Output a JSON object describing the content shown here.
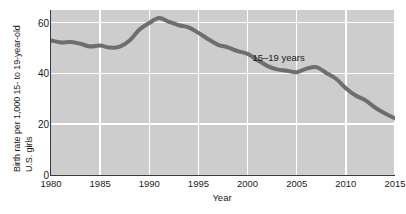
{
  "chart_data": {
    "type": "line",
    "title": "",
    "xlabel": "Year",
    "ylabel_line1": "Birth rate per 1,000 15- to 19-year-old",
    "ylabel_line2": "U.S. girls",
    "xlim": [
      1980,
      2015
    ],
    "ylim": [
      0,
      65
    ],
    "xticks": [
      "1980",
      "1985",
      "1990",
      "1995",
      "2000",
      "2005",
      "2010",
      "2015"
    ],
    "xtick_values": [
      1980,
      1985,
      1990,
      1995,
      2000,
      2005,
      2010,
      2015
    ],
    "yticks": [
      "0",
      "20",
      "40",
      "60"
    ],
    "ytick_values": [
      0,
      20,
      40,
      60
    ],
    "grid": true,
    "grid_color": "#ffffff",
    "plot_background": "#cdcdcd",
    "legend_position": "inline-annotation",
    "series": [
      {
        "name": "15–19 years",
        "color": "#6e6e6e",
        "annotation": "15–19 years",
        "x": [
          1980,
          1981,
          1982,
          1983,
          1984,
          1985,
          1986,
          1987,
          1988,
          1989,
          1990,
          1991,
          1992,
          1993,
          1994,
          1995,
          1996,
          1997,
          1998,
          1999,
          2000,
          2001,
          2002,
          2003,
          2004,
          2005,
          2006,
          2007,
          2008,
          2009,
          2010,
          2011,
          2012,
          2013,
          2014,
          2015
        ],
        "values": [
          53.0,
          52.2,
          52.4,
          51.7,
          50.6,
          51.0,
          50.2,
          50.6,
          53.0,
          57.3,
          59.9,
          61.8,
          60.3,
          59.0,
          58.2,
          56.0,
          53.5,
          51.3,
          50.3,
          48.8,
          47.7,
          45.3,
          43.0,
          41.6,
          41.1,
          40.5,
          41.9,
          42.5,
          40.2,
          37.9,
          34.2,
          31.3,
          29.4,
          26.5,
          24.2,
          22.3
        ]
      }
    ]
  },
  "axes": {
    "x_title": "Year",
    "y_title_line1": "Birth rate per 1,000 15- to 19-year-old",
    "y_title_line2": "U.S. girls"
  }
}
